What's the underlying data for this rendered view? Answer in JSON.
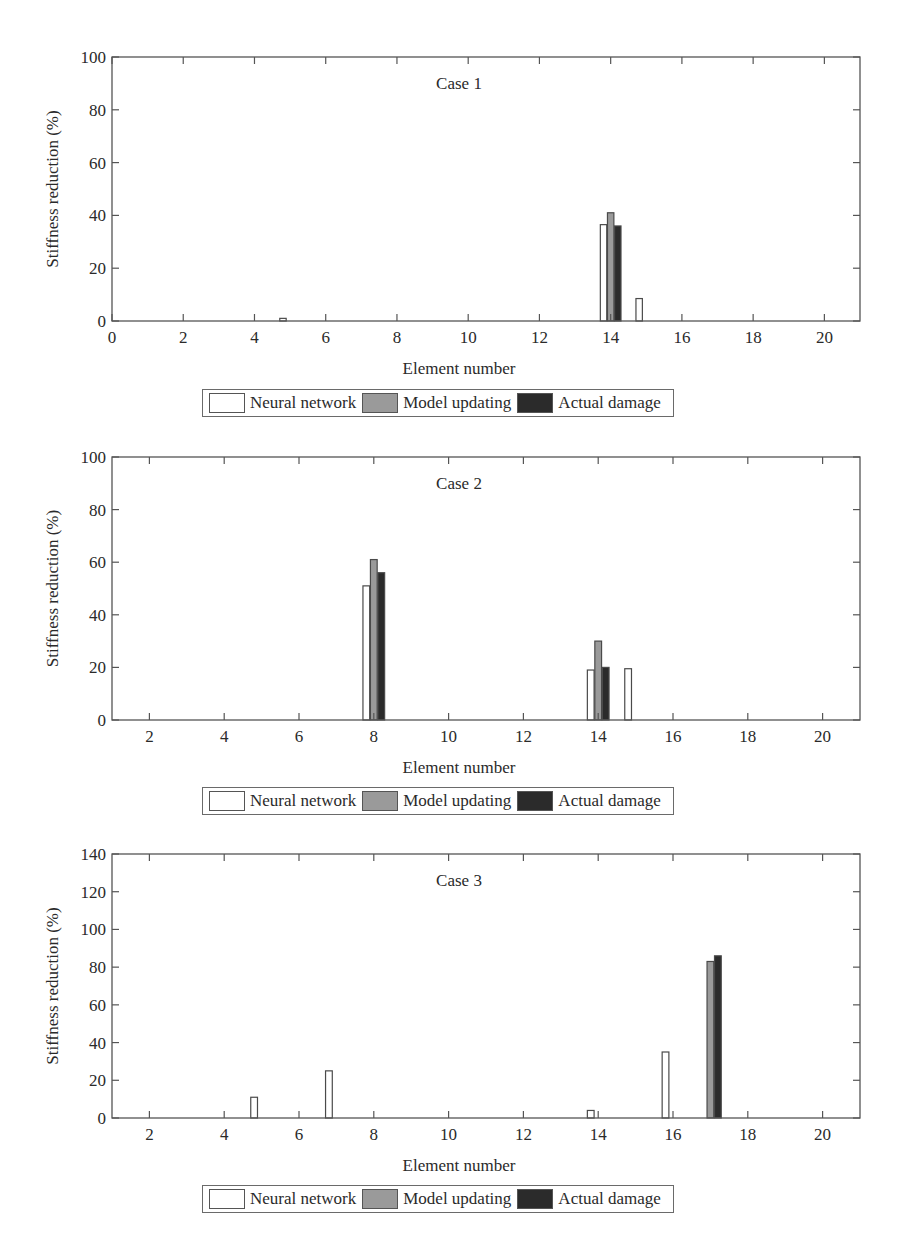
{
  "legend": {
    "items": [
      {
        "label": "Neural network",
        "color": "#ffffff"
      },
      {
        "label": "Model updating",
        "color": "#9a9a9a"
      },
      {
        "label": "Actual damage",
        "color": "#2b2b2b"
      }
    ]
  },
  "chart_data": [
    {
      "type": "bar",
      "title": "Case 1",
      "xlabel": "Element number",
      "ylabel": "Stiffness reduction (%)",
      "xlim": [
        0,
        21
      ],
      "ylim": [
        0,
        100
      ],
      "xticks": [
        0,
        2,
        4,
        6,
        8,
        10,
        12,
        14,
        16,
        18,
        20
      ],
      "yticks": [
        0,
        20,
        40,
        60,
        80,
        100
      ],
      "grid": false,
      "legend_position": "below",
      "categories": [
        1,
        2,
        3,
        4,
        5,
        6,
        7,
        8,
        9,
        10,
        11,
        12,
        13,
        14,
        15,
        16,
        17,
        18,
        19,
        20
      ],
      "series": [
        {
          "name": "Neural network",
          "values": [
            0,
            0,
            0,
            0,
            1,
            0,
            0,
            0,
            0,
            0,
            0,
            0,
            0,
            36.5,
            8.5,
            0,
            0,
            0,
            0,
            0
          ]
        },
        {
          "name": "Model updating",
          "values": [
            0,
            0,
            0,
            0,
            0,
            0,
            0,
            0,
            0,
            0,
            0,
            0,
            0,
            41,
            0,
            0,
            0,
            0,
            0,
            0
          ]
        },
        {
          "name": "Actual damage",
          "values": [
            0,
            0,
            0,
            0,
            0,
            0,
            0,
            0,
            0,
            0,
            0,
            0,
            0,
            36,
            0,
            0,
            0,
            0,
            0,
            0
          ]
        }
      ]
    },
    {
      "type": "bar",
      "title": "Case 2",
      "xlabel": "Element number",
      "ylabel": "Stiffness reduction (%)",
      "xlim": [
        1,
        21
      ],
      "ylim": [
        0,
        100
      ],
      "xticks": [
        2,
        4,
        6,
        8,
        10,
        12,
        14,
        16,
        18,
        20
      ],
      "yticks": [
        0,
        20,
        40,
        60,
        80,
        100
      ],
      "grid": false,
      "legend_position": "below",
      "categories": [
        1,
        2,
        3,
        4,
        5,
        6,
        7,
        8,
        9,
        10,
        11,
        12,
        13,
        14,
        15,
        16,
        17,
        18,
        19,
        20
      ],
      "series": [
        {
          "name": "Neural network",
          "values": [
            0,
            0,
            0,
            0,
            0,
            0,
            0,
            51,
            0,
            0,
            0,
            0,
            0,
            19,
            19.5,
            0,
            0,
            0,
            0,
            0
          ]
        },
        {
          "name": "Model updating",
          "values": [
            0,
            0,
            0,
            0,
            0,
            0,
            0,
            61,
            0,
            0,
            0,
            0,
            0,
            30,
            0,
            0,
            0,
            0,
            0,
            0
          ]
        },
        {
          "name": "Actual damage",
          "values": [
            0,
            0,
            0,
            0,
            0,
            0,
            0,
            56,
            0,
            0,
            0,
            0,
            0,
            20,
            0,
            0,
            0,
            0,
            0,
            0
          ]
        }
      ]
    },
    {
      "type": "bar",
      "title": "Case 3",
      "xlabel": "Element number",
      "ylabel": "Stiffness reduction (%)",
      "xlim": [
        1,
        21
      ],
      "ylim": [
        0,
        140
      ],
      "xticks": [
        2,
        4,
        6,
        8,
        10,
        12,
        14,
        16,
        18,
        20
      ],
      "yticks": [
        0,
        20,
        40,
        60,
        80,
        100,
        120,
        140
      ],
      "grid": false,
      "legend_position": "below",
      "categories": [
        1,
        2,
        3,
        4,
        5,
        6,
        7,
        8,
        9,
        10,
        11,
        12,
        13,
        14,
        15,
        16,
        17,
        18,
        19,
        20
      ],
      "series": [
        {
          "name": "Neural network",
          "values": [
            0,
            0,
            0,
            0,
            11,
            0,
            25,
            0,
            0,
            0,
            0,
            0,
            0,
            4,
            0,
            35,
            0,
            0,
            0,
            0
          ]
        },
        {
          "name": "Model updating",
          "values": [
            0,
            0,
            0,
            0,
            0,
            0,
            0,
            0,
            0,
            0,
            0,
            0,
            0,
            0,
            0,
            0,
            83,
            0,
            0,
            0
          ]
        },
        {
          "name": "Actual damage",
          "values": [
            0,
            0,
            0,
            0,
            0,
            0,
            0,
            0,
            0,
            0,
            0,
            0,
            0,
            0,
            0,
            0,
            86,
            0,
            0,
            0
          ]
        }
      ]
    }
  ]
}
